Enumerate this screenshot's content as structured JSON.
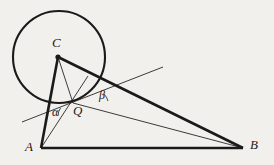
{
  "figure": {
    "background_color": "#f2f0ed",
    "stroke_color": "#1a1a1a",
    "width": 274,
    "height": 165,
    "points": {
      "A": {
        "label": "A",
        "x": 41,
        "y": 148
      },
      "B": {
        "label": "B",
        "x": 243,
        "y": 148
      },
      "C": {
        "label": "C",
        "x": 58,
        "y": 57
      },
      "Q": {
        "label": "Q",
        "x": 73,
        "y": 103
      }
    },
    "angles": {
      "alpha": {
        "label": "α",
        "vertex_x": 48,
        "vertex_y": 119
      },
      "beta": {
        "label": "β",
        "vertex_x": 93,
        "vertex_y": 104
      }
    },
    "circle": {
      "center_x": 59,
      "center_y": 57,
      "radius": 46,
      "stroke_width": 2
    },
    "segments": [
      {
        "name": "segment-AB",
        "x1": 41,
        "y1": 148,
        "x2": 243,
        "y2": 148,
        "weight": "thick"
      },
      {
        "name": "segment-AC",
        "x1": 41,
        "y1": 148,
        "x2": 58,
        "y2": 57,
        "weight": "thick"
      },
      {
        "name": "segment-CB",
        "x1": 58,
        "y1": 57,
        "x2": 243,
        "y2": 148,
        "weight": "thick"
      },
      {
        "name": "segment-CQ",
        "x1": 58,
        "y1": 57,
        "x2": 73,
        "y2": 103,
        "weight": "thin"
      },
      {
        "name": "segment-AQ-extended",
        "x1": 41,
        "y1": 148,
        "x2": 88,
        "y2": 76,
        "weight": "thin"
      },
      {
        "name": "segment-QB",
        "x1": 73,
        "y1": 103,
        "x2": 243,
        "y2": 148,
        "weight": "thin"
      },
      {
        "name": "tangent-line",
        "x1": 22,
        "y1": 122,
        "x2": 163,
        "y2": 67,
        "weight": "thin"
      }
    ],
    "arcs": {
      "alpha_arc": "small arc at angle alpha",
      "beta_arc": "small arc at angle beta"
    }
  }
}
